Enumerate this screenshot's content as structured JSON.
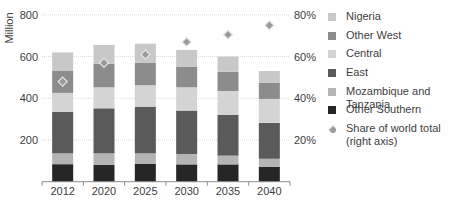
{
  "chart_data": {
    "type": "bar",
    "stacked": true,
    "title": "",
    "xlabel": "",
    "ylabel": "Million",
    "ylim": [
      0,
      800
    ],
    "yticks": [
      200,
      400,
      600,
      800
    ],
    "y2label": "Share of world total (right axis)",
    "y2lim": [
      0,
      80
    ],
    "y2ticks": [
      "20%",
      "40%",
      "60%",
      "80%"
    ],
    "grid": true,
    "legend_position": "right",
    "categories": [
      "2012",
      "2020",
      "2025",
      "2030",
      "2035",
      "2040"
    ],
    "series": [
      {
        "name": "Other Southern",
        "color": "#262626",
        "values": [
          84,
          80,
          85,
          83,
          83,
          72
        ]
      },
      {
        "name": "Mozambique and Tanzania",
        "color": "#b4b4b4",
        "values": [
          52,
          56,
          51,
          50,
          42,
          38
        ]
      },
      {
        "name": "East",
        "color": "#5a5a5a",
        "values": [
          199,
          216,
          224,
          208,
          195,
          172
        ]
      },
      {
        "name": "Central",
        "color": "#d4d4d4",
        "values": [
          91,
          101,
          103,
          112,
          115,
          115
        ]
      },
      {
        "name": "Other West",
        "color": "#8c8c8c",
        "values": [
          105,
          112,
          108,
          99,
          92,
          78
        ]
      },
      {
        "name": "Nigeria",
        "color": "#c8c8c8",
        "values": [
          89,
          91,
          91,
          80,
          73,
          56
        ]
      }
    ],
    "totals": [
      620,
      656,
      662,
      632,
      600,
      531
    ],
    "line_series": {
      "name": "Share of world total (right axis)",
      "marker": "diamond",
      "axis": "right",
      "color": "#9a9a9a",
      "values": [
        48,
        57,
        61,
        67,
        70.5,
        75
      ]
    }
  },
  "axis": {
    "ylabel": "Million",
    "left_ticks": [
      "200",
      "400",
      "600",
      "800"
    ],
    "right_ticks": [
      "20%",
      "40%",
      "60%",
      "80%"
    ]
  },
  "legend": {
    "items": [
      {
        "label": "Nigeria",
        "color": "#c8c8c8",
        "shape": "square"
      },
      {
        "label": "Other West",
        "color": "#8c8c8c",
        "shape": "square"
      },
      {
        "label": "Central",
        "color": "#d4d4d4",
        "shape": "square"
      },
      {
        "label": "East",
        "color": "#5a5a5a",
        "shape": "square"
      },
      {
        "label": "Mozambique and Tanzania",
        "color": "#b4b4b4",
        "shape": "square"
      },
      {
        "label": "Other Southern",
        "color": "#262626",
        "shape": "square"
      },
      {
        "label": "Share of world total",
        "label2": "(right axis)",
        "color": "#9a9a9a",
        "shape": "diamond"
      }
    ]
  }
}
